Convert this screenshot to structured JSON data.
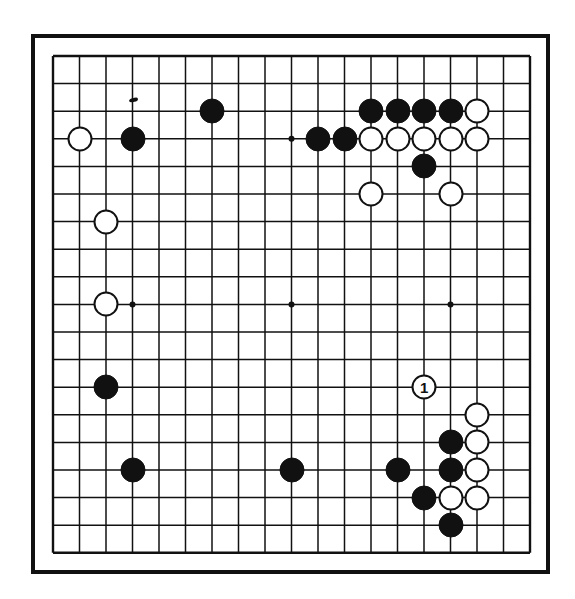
{
  "diagram": {
    "kind": "go-board-diagram",
    "board_size": 19,
    "title": "",
    "caption": "",
    "colors": {
      "line": "#111111",
      "board_background": "#ffffff",
      "black_stone": "#111111",
      "white_stone": "#ffffff",
      "page_background": "#ffffff"
    },
    "geometry": {
      "origin_x": 22,
      "origin_y": 22,
      "spacing_x": 26.5,
      "spacing_y": 27.6,
      "stone_diameter": 25,
      "star_dot_diameter": 6
    },
    "star_points": [
      {
        "col": 4,
        "row": 4
      },
      {
        "col": 10,
        "row": 4
      },
      {
        "col": 16,
        "row": 4
      },
      {
        "col": 4,
        "row": 10
      },
      {
        "col": 10,
        "row": 10
      },
      {
        "col": 16,
        "row": 10
      },
      {
        "col": 4,
        "row": 16
      },
      {
        "col": 10,
        "row": 16
      },
      {
        "col": 16,
        "row": 16
      }
    ],
    "ink_speck": {
      "col": 4,
      "row": 2.6
    },
    "stones": [
      {
        "id": "w-c2r4",
        "color": "white",
        "col": 2,
        "row": 4,
        "label": ""
      },
      {
        "id": "b-c4r4",
        "color": "black",
        "col": 4,
        "row": 4,
        "label": ""
      },
      {
        "id": "b-c7r3",
        "color": "black",
        "col": 7,
        "row": 3,
        "label": ""
      },
      {
        "id": "b-c11r4",
        "color": "black",
        "col": 11,
        "row": 4,
        "label": ""
      },
      {
        "id": "b-c12r4",
        "color": "black",
        "col": 12,
        "row": 4,
        "label": ""
      },
      {
        "id": "b-c13r3",
        "color": "black",
        "col": 13,
        "row": 3,
        "label": ""
      },
      {
        "id": "b-c14r3",
        "color": "black",
        "col": 14,
        "row": 3,
        "label": ""
      },
      {
        "id": "b-c15r3",
        "color": "black",
        "col": 15,
        "row": 3,
        "label": ""
      },
      {
        "id": "b-c16r3",
        "color": "black",
        "col": 16,
        "row": 3,
        "label": ""
      },
      {
        "id": "w-c17r3",
        "color": "white",
        "col": 17,
        "row": 3,
        "label": ""
      },
      {
        "id": "w-c13r4",
        "color": "white",
        "col": 13,
        "row": 4,
        "label": ""
      },
      {
        "id": "w-c14r4",
        "color": "white",
        "col": 14,
        "row": 4,
        "label": ""
      },
      {
        "id": "w-c15r4",
        "color": "white",
        "col": 15,
        "row": 4,
        "label": ""
      },
      {
        "id": "w-c16r4",
        "color": "white",
        "col": 16,
        "row": 4,
        "label": ""
      },
      {
        "id": "w-c17r4",
        "color": "white",
        "col": 17,
        "row": 4,
        "label": ""
      },
      {
        "id": "b-c15r5",
        "color": "black",
        "col": 15,
        "row": 5,
        "label": ""
      },
      {
        "id": "w-c13r6",
        "color": "white",
        "col": 13,
        "row": 6,
        "label": ""
      },
      {
        "id": "w-c16r6",
        "color": "white",
        "col": 16,
        "row": 6,
        "label": ""
      },
      {
        "id": "w-c3r7",
        "color": "white",
        "col": 3,
        "row": 7,
        "label": ""
      },
      {
        "id": "w-c3r10",
        "color": "white",
        "col": 3,
        "row": 10,
        "label": ""
      },
      {
        "id": "b-c3r13",
        "color": "black",
        "col": 3,
        "row": 13,
        "label": ""
      },
      {
        "id": "w-c15r13",
        "color": "white",
        "col": 15,
        "row": 13,
        "label": "1"
      },
      {
        "id": "w-c17r14",
        "color": "white",
        "col": 17,
        "row": 14,
        "label": ""
      },
      {
        "id": "b-c16r15",
        "color": "black",
        "col": 16,
        "row": 15,
        "label": ""
      },
      {
        "id": "w-c17r15",
        "color": "white",
        "col": 17,
        "row": 15,
        "label": ""
      },
      {
        "id": "b-c4r16",
        "color": "black",
        "col": 4,
        "row": 16,
        "label": ""
      },
      {
        "id": "b-c10r16",
        "color": "black",
        "col": 10,
        "row": 16,
        "label": ""
      },
      {
        "id": "b-c14r16",
        "color": "black",
        "col": 14,
        "row": 16,
        "label": ""
      },
      {
        "id": "b-c16r16",
        "color": "black",
        "col": 16,
        "row": 16,
        "label": ""
      },
      {
        "id": "w-c17r16",
        "color": "white",
        "col": 17,
        "row": 16,
        "label": ""
      },
      {
        "id": "b-c15r17",
        "color": "black",
        "col": 15,
        "row": 17,
        "label": ""
      },
      {
        "id": "w-c16r17",
        "color": "white",
        "col": 16,
        "row": 17,
        "label": ""
      },
      {
        "id": "w-c17r17",
        "color": "white",
        "col": 17,
        "row": 17,
        "label": ""
      },
      {
        "id": "b-c16r18",
        "color": "black",
        "col": 16,
        "row": 18,
        "label": ""
      }
    ]
  }
}
